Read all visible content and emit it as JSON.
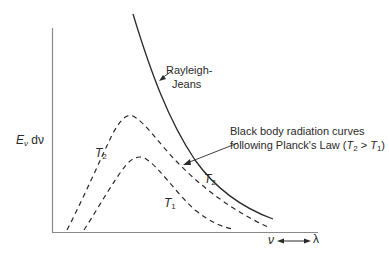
{
  "diagram": {
    "y_axis": {
      "label_main": "E",
      "label_sub": "ν",
      "label_tail": " dν"
    },
    "x_axis": {
      "label_left": "ν",
      "label_right": "λ",
      "arrow": "double-headed"
    },
    "labels": {
      "rayleigh_line1": "Rayleigh-",
      "rayleigh_line2": "Jeans",
      "planck_line1": "Black body radiation curves",
      "planck_line2_prefix": "following Planck's Law (",
      "planck_T2": "T",
      "planck_T2_sub": "2",
      "planck_gt": " > ",
      "planck_T1": "T",
      "planck_T1_sub": "1",
      "planck_close": ")",
      "T2_left": "T",
      "T2_left_sub": "2",
      "T2_right": "T",
      "T2_right_sub": "2",
      "T1": "T",
      "T1_sub": "1"
    },
    "colors": {
      "ink": "#2a2a2a",
      "axis": "#8a8a8a",
      "background": "#ffffff"
    },
    "curves": [
      {
        "name": "Rayleigh-Jeans",
        "style": "solid"
      },
      {
        "name": "Planck T2",
        "style": "dashed"
      },
      {
        "name": "Planck T1",
        "style": "dashed"
      }
    ]
  }
}
